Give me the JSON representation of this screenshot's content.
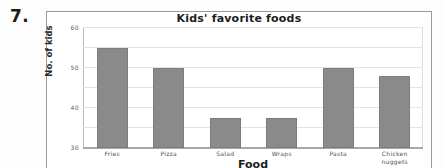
{
  "question": {
    "number": "7."
  },
  "chart_data": {
    "type": "bar",
    "title": "Kids' favorite foods",
    "xlabel": "Food",
    "ylabel": "No. of kids",
    "categories": [
      "Fries",
      "Pizza",
      "Salad",
      "Wraps",
      "Pasta",
      "Chicken nuggets"
    ],
    "category_lines": [
      [
        "Fries"
      ],
      [
        "Pizza"
      ],
      [
        "Salad"
      ],
      [
        "Wraps"
      ],
      [
        "Pasta"
      ],
      [
        "Chicken",
        "nuggets"
      ]
    ],
    "values": [
      50,
      40,
      15,
      15,
      40,
      36
    ],
    "ylim": [
      0,
      60
    ],
    "yticks": [
      0,
      10,
      20,
      30,
      40,
      50,
      60
    ],
    "ytick_labels": [
      "0",
      "10",
      "20",
      "30",
      "40",
      "50",
      "60"
    ],
    "grid": true,
    "legend": false,
    "bar_color": "#8a8a8a",
    "gridline_color": "#e3e3e3",
    "axis_color": "#a8a8a8"
  }
}
